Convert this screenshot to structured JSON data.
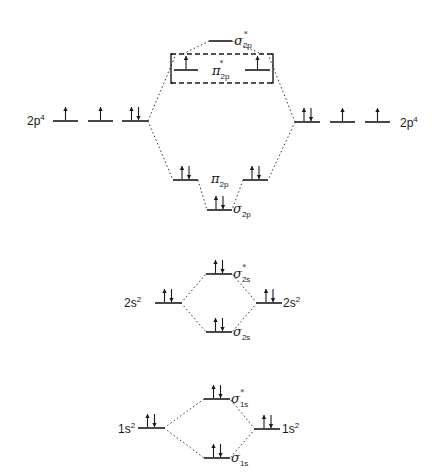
{
  "diagram": {
    "colors": {
      "ink": "#1a1a1a",
      "background": "#ffffff"
    },
    "atomic_labels": {
      "left_2p": {
        "base": "2p",
        "sup": "4"
      },
      "right_2p": {
        "base": "2p",
        "sup": "4"
      },
      "left_2s": {
        "base": "2s",
        "sup": "2"
      },
      "right_2s": {
        "base": "2s",
        "sup": "2"
      },
      "left_1s": {
        "base": "1s",
        "sup": "2"
      },
      "right_1s": {
        "base": "1s",
        "sup": "2"
      }
    },
    "molecular_labels": {
      "sigma_star_2p": {
        "symbol": "σ",
        "sub": "2p",
        "sup": "*"
      },
      "pi_star_2p": {
        "symbol": "π",
        "sub": "2p",
        "sup": "*"
      },
      "pi_2p": {
        "symbol": "π",
        "sub": "2p"
      },
      "sigma_2p": {
        "symbol": "σ",
        "sub": "2p"
      },
      "sigma_star_2s": {
        "symbol": "σ",
        "sub": "2s",
        "sup": "*"
      },
      "sigma_2s": {
        "symbol": "σ",
        "sub": "2s"
      },
      "sigma_star_1s": {
        "symbol": "σ",
        "sub": "1s",
        "sup": "*"
      },
      "sigma_1s": {
        "symbol": "σ",
        "sub": "1s"
      }
    },
    "levels": [
      {
        "id": "left-2p-a",
        "x1": 53,
        "x2": 78,
        "y": 121,
        "electrons": "up"
      },
      {
        "id": "left-2p-b",
        "x1": 88,
        "x2": 113,
        "y": 121,
        "electrons": "up"
      },
      {
        "id": "left-2p-c",
        "x1": 122,
        "x2": 148,
        "y": 121,
        "electrons": "pair"
      },
      {
        "id": "right-2p-a",
        "x1": 295,
        "x2": 320,
        "y": 122,
        "electrons": "pair"
      },
      {
        "id": "right-2p-b",
        "x1": 330,
        "x2": 355,
        "y": 122,
        "electrons": "up"
      },
      {
        "id": "right-2p-c",
        "x1": 365,
        "x2": 390,
        "y": 122,
        "electrons": "up"
      },
      {
        "id": "sigma-star-2p",
        "x1": 209,
        "x2": 232,
        "y": 41,
        "electrons": "none"
      },
      {
        "id": "pi-star-2p-left",
        "x1": 174,
        "x2": 198,
        "y": 70,
        "electrons": "up"
      },
      {
        "id": "pi-star-2p-right",
        "x1": 245,
        "x2": 270,
        "y": 70,
        "electrons": "up"
      },
      {
        "id": "pi-2p-left",
        "x1": 173,
        "x2": 198,
        "y": 180,
        "electrons": "pair"
      },
      {
        "id": "pi-2p-right",
        "x1": 243,
        "x2": 268,
        "y": 180,
        "electrons": "pair"
      },
      {
        "id": "sigma-2p",
        "x1": 207,
        "x2": 232,
        "y": 210,
        "electrons": "pair"
      },
      {
        "id": "left-2s",
        "x1": 155,
        "x2": 181,
        "y": 303,
        "electrons": "pair"
      },
      {
        "id": "right-2s",
        "x1": 257,
        "x2": 282,
        "y": 303,
        "electrons": "pair"
      },
      {
        "id": "sigma-star-2s",
        "x1": 206,
        "x2": 232,
        "y": 274,
        "electrons": "pair"
      },
      {
        "id": "sigma-2s",
        "x1": 206,
        "x2": 232,
        "y": 332,
        "electrons": "pair"
      },
      {
        "id": "left-1s",
        "x1": 138,
        "x2": 164,
        "y": 428,
        "electrons": "pair"
      },
      {
        "id": "right-1s",
        "x1": 255,
        "x2": 280,
        "y": 429,
        "electrons": "pair"
      },
      {
        "id": "sigma-star-1s",
        "x1": 204,
        "x2": 230,
        "y": 399,
        "electrons": "pair"
      },
      {
        "id": "sigma-1s",
        "x1": 204,
        "x2": 230,
        "y": 458,
        "electrons": "pair"
      }
    ],
    "connectors": [
      [
        148,
        121,
        176,
        54
      ],
      [
        148,
        121,
        173,
        180
      ],
      [
        295,
        122,
        268,
        54
      ],
      [
        295,
        122,
        268,
        180
      ],
      [
        183,
        54,
        209,
        41
      ],
      [
        232,
        41,
        262,
        54
      ],
      [
        198,
        180,
        207,
        210
      ],
      [
        243,
        180,
        232,
        210
      ],
      [
        181,
        303,
        206,
        274
      ],
      [
        181,
        303,
        206,
        332
      ],
      [
        257,
        303,
        232,
        274
      ],
      [
        257,
        303,
        232,
        332
      ],
      [
        164,
        428,
        204,
        399
      ],
      [
        164,
        428,
        204,
        458
      ],
      [
        255,
        429,
        230,
        399
      ],
      [
        255,
        429,
        230,
        458
      ]
    ],
    "box": {
      "x1": 171,
      "x2": 273,
      "y1": 54,
      "y2": 83
    }
  }
}
